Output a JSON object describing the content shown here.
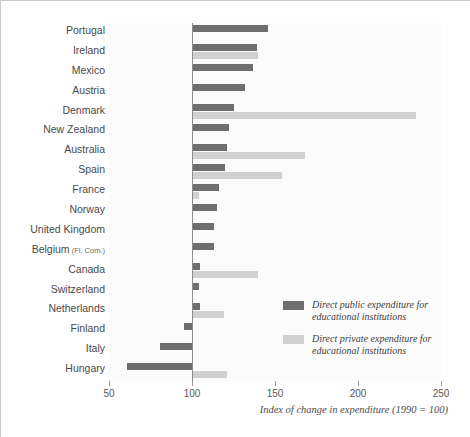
{
  "chart_data": {
    "type": "bar",
    "orientation": "horizontal",
    "title": "",
    "xlabel": "Index of change in expenditure (1990 = 100)",
    "ylabel": "",
    "xlim": [
      50,
      250
    ],
    "xticks": [
      50,
      100,
      150,
      200,
      250
    ],
    "baseline": 100,
    "grid": false,
    "legend_position": "inside-right",
    "categories": [
      "Portugal",
      "Ireland",
      "Mexico",
      "Austria",
      "Denmark",
      "New Zealand",
      "Australia",
      "Spain",
      "France",
      "Norway",
      "United Kingdom",
      "Belgium (Fl. Com.)",
      "Canada",
      "Switzerland",
      "Netherlands",
      "Finland",
      "Italy",
      "Hungary"
    ],
    "series": [
      {
        "name": "Direct public expenditure for educational institutions",
        "color": "#6e6e6e",
        "values": [
          146,
          139,
          137,
          132,
          125,
          122,
          121,
          120,
          116,
          115,
          113,
          113,
          105,
          104,
          105,
          95,
          81,
          61
        ]
      },
      {
        "name": "Direct private expenditure for educational institutions",
        "color": "#d0d0d0",
        "values": [
          null,
          140,
          null,
          null,
          235,
          null,
          168,
          154,
          104,
          null,
          null,
          null,
          140,
          null,
          119,
          null,
          null,
          121
        ]
      }
    ]
  },
  "axis": {
    "tick_labels": [
      "50",
      "100",
      "150",
      "200",
      "250"
    ],
    "caption": "Index of change in expenditure (1990 = 100)"
  },
  "labels": [
    {
      "name": "Portugal",
      "sub": ""
    },
    {
      "name": "Ireland",
      "sub": ""
    },
    {
      "name": "Mexico",
      "sub": ""
    },
    {
      "name": "Austria",
      "sub": ""
    },
    {
      "name": "Denmark",
      "sub": ""
    },
    {
      "name": "New Zealand",
      "sub": ""
    },
    {
      "name": "Australia",
      "sub": ""
    },
    {
      "name": "Spain",
      "sub": ""
    },
    {
      "name": "France",
      "sub": ""
    },
    {
      "name": "Norway",
      "sub": ""
    },
    {
      "name": "United Kingdom",
      "sub": ""
    },
    {
      "name": "Belgium",
      "sub": "(Fl. Com.)"
    },
    {
      "name": "Canada",
      "sub": ""
    },
    {
      "name": "Switzerland",
      "sub": ""
    },
    {
      "name": "Netherlands",
      "sub": ""
    },
    {
      "name": "Finland",
      "sub": ""
    },
    {
      "name": "Italy",
      "sub": ""
    },
    {
      "name": "Hungary",
      "sub": ""
    }
  ],
  "legend": {
    "items": [
      {
        "label": "Direct public expenditure for educational institutions",
        "color": "#6e6e6e"
      },
      {
        "label": "Direct private expenditure for educational institutions",
        "color": "#d0d0d0"
      }
    ]
  },
  "colors": {
    "public": "#6e6e6e",
    "private": "#d0d0d0",
    "baseline": "#8d8d8d",
    "frame": "#c9c9c9",
    "plot_bg": "#fbfbfb"
  }
}
